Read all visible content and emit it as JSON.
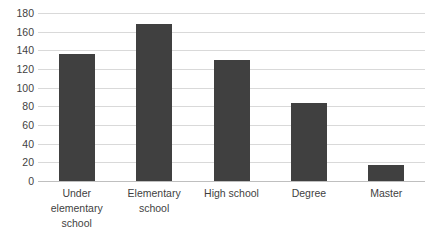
{
  "chart_data": {
    "type": "bar",
    "title": "",
    "subtitle": "",
    "xlabel": "",
    "ylabel": "",
    "categories": [
      "Under elementary school",
      "Elementary school",
      "High school",
      "Degree",
      "Master"
    ],
    "values": [
      136,
      168,
      130,
      84,
      17
    ],
    "ylim": [
      0,
      180
    ],
    "yticks": [
      180,
      160,
      140,
      120,
      100,
      80,
      60,
      40,
      20,
      0
    ],
    "ytick_labels": [
      "180",
      "160",
      "140",
      "120",
      "100",
      "80",
      "60",
      "40",
      "20",
      "0"
    ],
    "grid": true,
    "legend": false,
    "legend_position": "none",
    "bar_color": "#404040",
    "gridline_color": "#d9d9d9",
    "axis_color": "#bfbfbf",
    "background_color": "#ffffff",
    "text_color": "#3f3f3f"
  }
}
